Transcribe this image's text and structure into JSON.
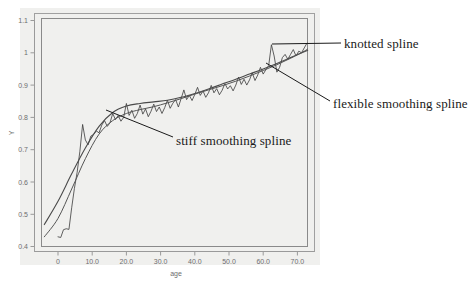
{
  "chart_data": {
    "type": "line",
    "title": "",
    "xlabel": "age",
    "ylabel": "Y",
    "xlim": [
      -6,
      76
    ],
    "ylim": [
      0.39,
      1.12
    ],
    "grid": false,
    "legend_position": "annotations",
    "x_ticks": [
      "0",
      "10.0",
      "20.0",
      "30.0",
      "40.0",
      "50.0",
      "60.0",
      "70.0"
    ],
    "x_tick_values": [
      0,
      10,
      20,
      30,
      40,
      50,
      60,
      70
    ],
    "y_ticks": [
      "0.4",
      "0.5",
      "0.6",
      "0.7",
      "0.8",
      "0.9",
      "1",
      "1.1"
    ],
    "y_tick_values": [
      0.4,
      0.5,
      0.6,
      0.7,
      0.8,
      0.9,
      1.0,
      1.1
    ],
    "series": [
      {
        "name": "knotted spline",
        "description": "noisy jagged observed data / knotted spline fit",
        "x": [
          0,
          0.8,
          1.6,
          2.4,
          3.2,
          4,
          4.8,
          5.6,
          6.4,
          7.2,
          8,
          8.8,
          9.6,
          10.4,
          11.2,
          12,
          12.8,
          13.6,
          14.4,
          15.2,
          16,
          16.8,
          17.6,
          18.4,
          19.2,
          20,
          20.8,
          21.6,
          22.4,
          23.2,
          24,
          24.8,
          25.6,
          26.4,
          27.2,
          28,
          28.8,
          29.6,
          30.4,
          31.2,
          32,
          32.8,
          33.6,
          34.4,
          35.2,
          36,
          36.8,
          37.6,
          38.4,
          39.2,
          40,
          40.8,
          41.6,
          42.4,
          43.2,
          44,
          44.8,
          45.6,
          46.4,
          47.2,
          48,
          48.8,
          49.6,
          50.4,
          51.2,
          52,
          52.8,
          53.6,
          54.4,
          55.2,
          56,
          56.8,
          57.6,
          58.4,
          59.2,
          60,
          60.8,
          61.6,
          62.4,
          63.2,
          64,
          64.8,
          65.6,
          66.4,
          67.2,
          68,
          68.8,
          69.6,
          70.4,
          71.2,
          72,
          72.8
        ],
        "y": [
          0.43,
          0.428,
          0.452,
          0.455,
          0.453,
          0.52,
          0.58,
          0.63,
          0.695,
          0.778,
          0.73,
          0.715,
          0.742,
          0.747,
          0.758,
          0.752,
          0.776,
          0.79,
          0.772,
          0.783,
          0.812,
          0.793,
          0.806,
          0.788,
          0.8,
          0.843,
          0.806,
          0.822,
          0.797,
          0.812,
          0.838,
          0.81,
          0.826,
          0.802,
          0.819,
          0.841,
          0.818,
          0.832,
          0.812,
          0.83,
          0.853,
          0.828,
          0.844,
          0.855,
          0.832,
          0.858,
          0.885,
          0.855,
          0.868,
          0.852,
          0.871,
          0.893,
          0.868,
          0.882,
          0.862,
          0.876,
          0.899,
          0.876,
          0.889,
          0.87,
          0.884,
          0.905,
          0.888,
          0.898,
          0.882,
          0.9,
          0.925,
          0.902,
          0.918,
          0.9,
          0.916,
          0.938,
          0.914,
          0.931,
          0.955,
          0.934,
          0.948,
          0.96,
          1.025,
          0.99,
          0.94,
          0.955,
          0.985,
          0.995,
          0.98,
          0.995,
          1.01,
          0.99,
          1.005,
          1.0,
          1.015,
          1.03
        ]
      },
      {
        "name": "stiff smoothing spline",
        "description": "heavily smoothed spline, bulges above data at ages 15-30",
        "x": [
          -4,
          0,
          4,
          8,
          12,
          16,
          20,
          24,
          28,
          32,
          36,
          40,
          44,
          48,
          52,
          56,
          60,
          64,
          68,
          72,
          73
        ],
        "y": [
          0.468,
          0.54,
          0.625,
          0.705,
          0.772,
          0.815,
          0.835,
          0.843,
          0.848,
          0.853,
          0.862,
          0.874,
          0.888,
          0.903,
          0.918,
          0.934,
          0.95,
          0.967,
          0.985,
          1.003,
          1.008
        ]
      },
      {
        "name": "flexible smoothing spline",
        "description": "moderately smoothed spline following data more closely",
        "x": [
          -4,
          0,
          4,
          8,
          12,
          16,
          20,
          24,
          28,
          32,
          36,
          40,
          44,
          48,
          52,
          56,
          60,
          64,
          68,
          72,
          73
        ],
        "y": [
          0.43,
          0.487,
          0.578,
          0.672,
          0.748,
          0.79,
          0.812,
          0.824,
          0.833,
          0.845,
          0.858,
          0.872,
          0.885,
          0.898,
          0.912,
          0.928,
          0.945,
          0.963,
          0.983,
          1.005,
          1.012
        ]
      }
    ],
    "annotations": [
      {
        "label": "knotted spline",
        "text_x": 344,
        "text_y": 43,
        "leader_from": [
          341,
          43
        ],
        "leader_to": [
          272,
          44
        ]
      },
      {
        "label": "flexible smoothing spline",
        "text_x": 333,
        "text_y": 103,
        "leader_from": [
          330,
          101
        ],
        "leader_to": [
          266,
          63
        ]
      },
      {
        "label": "stiff smoothing spline",
        "text_x": 176,
        "text_y": 140,
        "leader_from": [
          173,
          137
        ],
        "leader_to": [
          106,
          110
        ]
      }
    ]
  },
  "colors": {
    "panel_background": "#f0f0ee",
    "page_background": "#ffffff",
    "axis": "#808080",
    "frame": "#8a8a8a",
    "data_line": "#3a3a3a",
    "spline_line": "#555555",
    "tick_label": "#6e6e6e",
    "annotation_text": "#1a1a1a",
    "leader_line": "#1a1a1a"
  }
}
